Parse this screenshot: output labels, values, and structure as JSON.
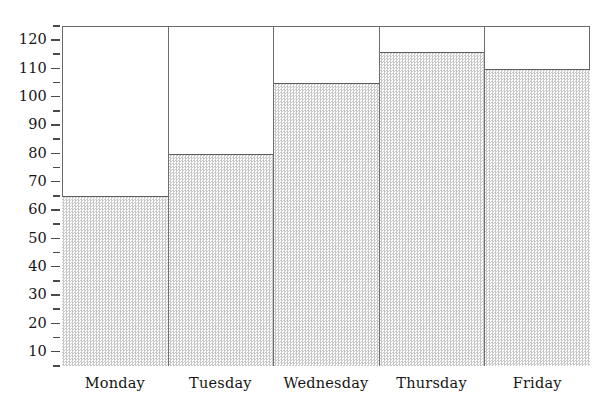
{
  "chart_data": {
    "type": "bar",
    "title": "",
    "subtitle": "",
    "xlabel": "",
    "ylabel": "",
    "categories": [
      "Monday",
      "Tuesday",
      "Wednesday",
      "Thursday",
      "Friday"
    ],
    "values": [
      65,
      80,
      105,
      116,
      110
    ],
    "ylim": [
      5,
      125
    ],
    "y_major_ticks": [
      10,
      20,
      30,
      40,
      50,
      60,
      70,
      80,
      90,
      100,
      110,
      120
    ],
    "y_minor_ticks": [
      5,
      15,
      25,
      35,
      45,
      55,
      65,
      75,
      85,
      95,
      105,
      115,
      125
    ],
    "y_tick_labels": [
      "10",
      "20",
      "30",
      "40",
      "50",
      "60",
      "70",
      "80",
      "90",
      "100",
      "110",
      "120"
    ],
    "grid": false,
    "legend": null,
    "legend_position": "none",
    "annotations": [],
    "bar_gap": 0,
    "colors": {
      "bar_fill": "#d9d9d9",
      "bar_fill_pattern": "dither-checker",
      "bar_outline": "#5e5e5e",
      "frame": "#6a6a6a",
      "tick": "#4a4a4a",
      "text": "#161616",
      "background": "#ffffff"
    }
  },
  "axis_geometry": {
    "plot_left_px": 62,
    "plot_top_px": 26,
    "plot_width_px": 528,
    "plot_height_px": 340,
    "value_at_plot_top": 125,
    "value_at_plot_bottom": 5
  }
}
